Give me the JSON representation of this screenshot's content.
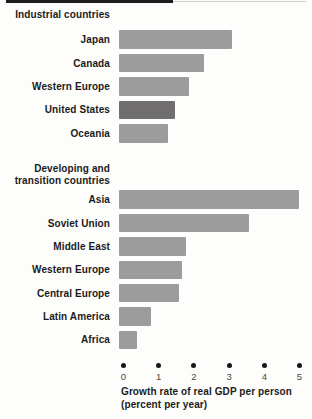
{
  "figure": {
    "axis_label_line1": "Growth rate of real GDP per person",
    "axis_label_line2": "(percent per year)"
  },
  "chart_data": {
    "type": "bar",
    "orientation": "horizontal",
    "xlabel": "Growth rate of real GDP per person (percent per year)",
    "axis_label_lines": [
      "Growth rate of real GDP per person",
      "(percent per year)"
    ],
    "xlim": [
      0,
      5
    ],
    "x_ticks": [
      0,
      1,
      2,
      3,
      4,
      5
    ],
    "grid": false,
    "legend": "none",
    "groups": [
      {
        "header_lines": [
          "Industrial countries"
        ],
        "rows": [
          {
            "label": "Japan",
            "value": 3.2
          },
          {
            "label": "Canada",
            "value": 2.4
          },
          {
            "label": "Western Europe",
            "value": 2.0
          },
          {
            "label": "United States",
            "value": 1.6,
            "highlight": true
          },
          {
            "label": "Oceania",
            "value": 1.4
          }
        ]
      },
      {
        "header_lines": [
          "Developing and",
          "transition countries"
        ],
        "rows": [
          {
            "label": "Asia",
            "value": 5.1
          },
          {
            "label": "Soviet Union",
            "value": 3.7
          },
          {
            "label": "Middle East",
            "value": 1.9
          },
          {
            "label": "Western Europe",
            "value": 1.8
          },
          {
            "label": "Central Europe",
            "value": 1.7
          },
          {
            "label": "Latin America",
            "value": 0.9
          },
          {
            "label": "Africa",
            "value": 0.5
          }
        ]
      }
    ],
    "colors": {
      "bar": "#9c9c9c",
      "bar_highlight": "#706e6f",
      "tick_dot": "#161616"
    }
  }
}
